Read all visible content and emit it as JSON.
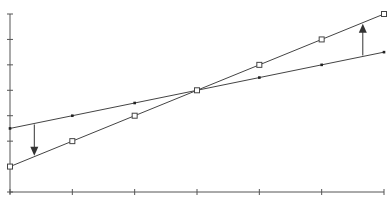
{
  "chart_data": {
    "type": "line",
    "title": "",
    "xlabel": "",
    "ylabel": "",
    "x": [
      0,
      1,
      2,
      3,
      4,
      5,
      6
    ],
    "x_tick_count": 7,
    "y_tick_count": 8,
    "xlim": [
      0,
      6
    ],
    "ylim": [
      0,
      7
    ],
    "grid": false,
    "legend": null,
    "series": [
      {
        "name": "Series A (small filled markers)",
        "marker": "filled-dot",
        "values": [
          2.5,
          3.0,
          3.5,
          4.0,
          4.5,
          5.0,
          5.5
        ]
      },
      {
        "name": "Series B (open square markers)",
        "marker": "open-square",
        "values": [
          1.0,
          2.0,
          3.0,
          4.0,
          5.0,
          6.0,
          7.0
        ]
      }
    ],
    "annotations": [
      {
        "type": "arrow",
        "direction": "down",
        "x": 0.39,
        "from_series": "Series A",
        "to_series": "Series B"
      },
      {
        "type": "arrow",
        "direction": "up",
        "x": 5.66,
        "from_series": "Series A",
        "to_series": "Series B"
      }
    ]
  },
  "colors": {
    "axis": "#555555",
    "line": "#444444",
    "marker_fill": "#222222",
    "arrow": "#333333",
    "background": "#ffffff"
  }
}
